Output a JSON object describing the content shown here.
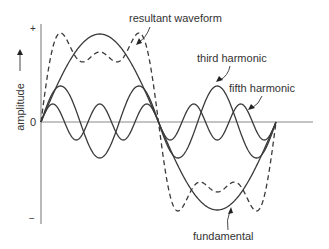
{
  "axes": {
    "y_label": "amplitude",
    "y_plus": "+",
    "y_minus": "−",
    "origin": "0"
  },
  "geometry": {
    "x0": 41,
    "period": 235,
    "zero_y": 122,
    "x_axis_end": 313,
    "y_axis_top": 24,
    "y_axis_bottom": 224
  },
  "waves": [
    {
      "id": "fundamental",
      "label": "fundamental",
      "harmonic": 1,
      "amplitude": 88,
      "style": "solid"
    },
    {
      "id": "third",
      "label": "third harmonic",
      "harmonic": 3,
      "amplitude": 36,
      "style": "solid"
    },
    {
      "id": "fifth",
      "label": "fifth harmonic",
      "harmonic": 5,
      "amplitude": 18,
      "style": "solid"
    },
    {
      "id": "resultant",
      "label": "resultant waveform",
      "harmonic": 0,
      "amplitude": 0,
      "style": "dashed"
    }
  ],
  "labels": {
    "resultant": "resultant waveform",
    "third": "third harmonic",
    "fifth": "fifth harmonic",
    "fundamental": "fundamental"
  }
}
